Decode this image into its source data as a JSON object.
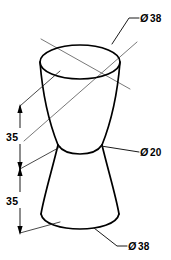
{
  "drawing": {
    "title": "Double cone isometric dimensioned drawing",
    "projection": "isometric",
    "units": "mm",
    "line_color": "#000000",
    "background_color": "#ffffff",
    "centerline_color": "#555555"
  },
  "callouts": {
    "top_diameter": {
      "symbol": "Ø",
      "value": "38",
      "label": "Ø 38",
      "target": "top-ellipse-edge"
    },
    "waist_diameter": {
      "symbol": "Ø",
      "value": "20",
      "label": "Ø 20",
      "target": "waist-edge"
    },
    "bottom_diameter": {
      "symbol": "Ø",
      "value": "38",
      "label": "Ø 38",
      "target": "bottom-edge"
    }
  },
  "dimensions": {
    "upper_height": {
      "value": "35",
      "label": "35",
      "orientation": "vertical",
      "describes": "upper cone height"
    },
    "lower_height": {
      "value": "35",
      "label": "35",
      "orientation": "vertical",
      "describes": "lower cone height"
    }
  },
  "geometry": {
    "top_ellipse": {
      "cx": 80,
      "cy": 62,
      "rx": 40,
      "ry": 17
    },
    "waist": {
      "cx": 80,
      "cy": 150,
      "rx": 22,
      "ry": 9
    },
    "bottom_ellipse": {
      "cx": 80,
      "cy": 219,
      "rx": 40,
      "ry": 17
    }
  }
}
